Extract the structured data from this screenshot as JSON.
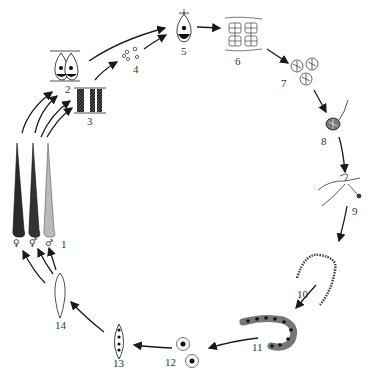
{
  "diagram": {
    "type": "life-cycle",
    "stages": [
      {
        "id": 1,
        "label": "1",
        "x": 40,
        "y": 302
      },
      {
        "id": 2,
        "label": "2",
        "x": 66,
        "y": 94
      },
      {
        "id": 3,
        "label": "3",
        "x": 88,
        "y": 117
      },
      {
        "id": 4,
        "label": "4",
        "x": 133,
        "y": 70
      },
      {
        "id": 5,
        "label": "5",
        "x": 183,
        "y": 50
      },
      {
        "id": 6,
        "label": "6",
        "x": 236,
        "y": 60
      },
      {
        "id": 7,
        "label": "7",
        "x": 283,
        "y": 82
      },
      {
        "id": 8,
        "label": "8",
        "x": 324,
        "y": 143
      },
      {
        "id": 9,
        "label": "9",
        "x": 350,
        "y": 212
      },
      {
        "id": 10,
        "label": "10",
        "x": 298,
        "y": 293
      },
      {
        "id": 11,
        "label": "11",
        "x": 253,
        "y": 345
      },
      {
        "id": 12,
        "label": "12",
        "x": 168,
        "y": 364
      },
      {
        "id": 13,
        "label": "13",
        "x": 114,
        "y": 364
      },
      {
        "id": 14,
        "label": "14",
        "x": 56,
        "y": 326
      }
    ],
    "sex_symbols": [
      "♀",
      "⚥",
      "♂"
    ],
    "colors": {
      "ink": "#1a1a1a",
      "background": "#ffffff"
    }
  }
}
